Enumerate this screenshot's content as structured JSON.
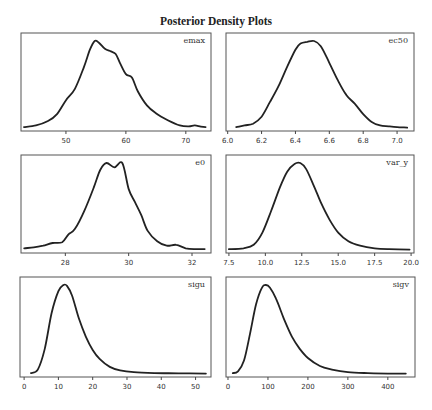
{
  "title": "Posterior Density Plots",
  "chart_data": [
    {
      "type": "line",
      "name": "emax",
      "label": "emax",
      "box": [
        21,
        33,
        211,
        131
      ],
      "xrange": [
        42.5,
        74.2
      ],
      "ticks": [
        50,
        60,
        70
      ],
      "tick_labels": [
        "50",
        "60",
        "70"
      ],
      "x": [
        43,
        45,
        47,
        48.5,
        50,
        51.5,
        53,
        54,
        54.8,
        55.5,
        56.5,
        57.5,
        58.3,
        59,
        60,
        61,
        62,
        63.5,
        65,
        67,
        69,
        70.5,
        71.5,
        72.5,
        73.3
      ],
      "y": [
        0.01,
        0.03,
        0.08,
        0.16,
        0.32,
        0.45,
        0.7,
        0.9,
        1.0,
        0.98,
        0.91,
        0.88,
        0.85,
        0.75,
        0.62,
        0.58,
        0.42,
        0.26,
        0.17,
        0.09,
        0.03,
        0.02,
        0.03,
        0.015,
        0.01
      ]
    },
    {
      "type": "line",
      "name": "ec50",
      "label": "ec50",
      "box": [
        226,
        33,
        414,
        131
      ],
      "xrange": [
        5.99,
        7.1
      ],
      "ticks": [
        6.0,
        6.2,
        6.4,
        6.6,
        6.8,
        7.0
      ],
      "tick_labels": [
        "6.0",
        "6.2",
        "6.4",
        "6.6",
        "6.8",
        "7.0"
      ],
      "x": [
        6.05,
        6.1,
        6.15,
        6.2,
        6.25,
        6.3,
        6.35,
        6.4,
        6.43,
        6.47,
        6.51,
        6.55,
        6.6,
        6.65,
        6.7,
        6.75,
        6.8,
        6.85,
        6.9,
        6.95,
        7.0,
        7.06
      ],
      "y": [
        0.01,
        0.03,
        0.05,
        0.13,
        0.3,
        0.48,
        0.7,
        0.9,
        0.97,
        0.99,
        1.0,
        0.94,
        0.75,
        0.55,
        0.38,
        0.28,
        0.16,
        0.07,
        0.03,
        0.02,
        0.01,
        0.005
      ]
    },
    {
      "type": "line",
      "name": "e0",
      "label": "e0",
      "box": [
        21,
        155,
        211,
        253
      ],
      "xrange": [
        26.6,
        32.6
      ],
      "ticks": [
        28,
        30,
        32
      ],
      "tick_labels": [
        "28",
        "30",
        "32"
      ],
      "x": [
        26.7,
        27.0,
        27.3,
        27.6,
        27.9,
        28.1,
        28.3,
        28.6,
        28.9,
        29.1,
        29.3,
        29.55,
        29.8,
        30.0,
        30.2,
        30.4,
        30.6,
        30.9,
        31.2,
        31.5,
        31.8,
        32.1,
        32.4
      ],
      "y": [
        0.02,
        0.03,
        0.05,
        0.08,
        0.09,
        0.18,
        0.24,
        0.45,
        0.72,
        0.92,
        1.0,
        0.95,
        1.0,
        0.7,
        0.55,
        0.4,
        0.22,
        0.1,
        0.05,
        0.06,
        0.02,
        0.01,
        0.01
      ]
    },
    {
      "type": "line",
      "name": "var_y",
      "label": "var_y",
      "box": [
        226,
        155,
        414,
        253
      ],
      "xrange": [
        7.3,
        20.2
      ],
      "ticks": [
        7.5,
        10.0,
        12.5,
        15.0,
        17.5,
        20.0
      ],
      "tick_labels": [
        "7.5",
        "10.0",
        "12.5",
        "15.0",
        "17.5",
        "20.0"
      ],
      "x": [
        7.5,
        8.5,
        9.2,
        9.8,
        10.4,
        11.0,
        11.5,
        12.0,
        12.4,
        12.8,
        13.3,
        13.8,
        14.4,
        15.0,
        15.7,
        16.5,
        17.5,
        18.5,
        19.9
      ],
      "y": [
        0.01,
        0.02,
        0.06,
        0.2,
        0.45,
        0.72,
        0.9,
        0.99,
        1.0,
        0.93,
        0.75,
        0.55,
        0.35,
        0.2,
        0.1,
        0.05,
        0.02,
        0.01,
        0.005
      ]
    },
    {
      "type": "line",
      "name": "sigu",
      "label": "sigu",
      "box": [
        20,
        277,
        211,
        377
      ],
      "xrange": [
        -1.2,
        54.5
      ],
      "ticks": [
        0,
        10,
        20,
        30,
        40,
        50
      ],
      "tick_labels": [
        "0",
        "10",
        "20",
        "30",
        "40",
        "50"
      ],
      "x": [
        2,
        4,
        6,
        8,
        10,
        11.5,
        12.5,
        14,
        16,
        18,
        20,
        22,
        25,
        28,
        32,
        38,
        45,
        53
      ],
      "y": [
        0.01,
        0.05,
        0.28,
        0.68,
        0.93,
        1.0,
        0.99,
        0.88,
        0.62,
        0.42,
        0.27,
        0.17,
        0.08,
        0.04,
        0.02,
        0.01,
        0.008,
        0.005
      ]
    },
    {
      "type": "line",
      "name": "sigv",
      "label": "sigv",
      "box": [
        226,
        277,
        415,
        377
      ],
      "xrange": [
        -5,
        468
      ],
      "ticks": [
        0,
        100,
        200,
        300,
        400
      ],
      "tick_labels": [
        "0",
        "100",
        "200",
        "300",
        "400"
      ],
      "x": [
        12,
        25,
        40,
        55,
        70,
        85,
        95,
        105,
        120,
        140,
        160,
        180,
        200,
        230,
        260,
        300,
        350,
        400,
        445
      ],
      "y": [
        0.01,
        0.03,
        0.15,
        0.45,
        0.78,
        0.97,
        1.0,
        0.97,
        0.85,
        0.62,
        0.42,
        0.28,
        0.18,
        0.09,
        0.05,
        0.02,
        0.01,
        0.005,
        0.004
      ]
    }
  ]
}
